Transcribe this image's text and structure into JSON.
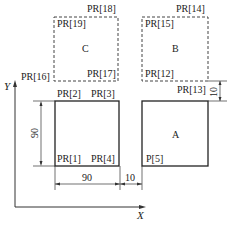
{
  "diagram": {
    "axes": {
      "x_label": "X",
      "y_label": "Y"
    },
    "regions": {
      "C": {
        "label": "C",
        "style": "dashed",
        "corners": [
          "PR[19]",
          "PR[18]",
          "PR[17]",
          "PR[16]"
        ]
      },
      "B": {
        "label": "B",
        "style": "dashed",
        "corners": [
          "PR[15]",
          "PR[14]",
          "PR[13]",
          "PR[12]"
        ]
      },
      "origin_square": {
        "label": "",
        "style": "solid",
        "corners": [
          "PR[2]",
          "PR[3]",
          "PR[4]",
          "PR[1]"
        ]
      },
      "A": {
        "label": "A",
        "style": "solid",
        "corners": [
          "P[5]"
        ]
      }
    },
    "points": {
      "pr1": "PR[1]",
      "pr2": "PR[2]",
      "pr3": "PR[3]",
      "pr4": "PR[4]",
      "p5": "P[5]",
      "pr12": "PR[12]",
      "pr13": "PR[13]",
      "pr14": "PR[14]",
      "pr15": "PR[15]",
      "pr16": "PR[16]",
      "pr17": "PR[17]",
      "pr18": "PR[18]",
      "pr19": "PR[19]"
    },
    "dimensions": {
      "height": "90",
      "width": "90",
      "gap_x": "10",
      "gap_y": "10"
    }
  }
}
